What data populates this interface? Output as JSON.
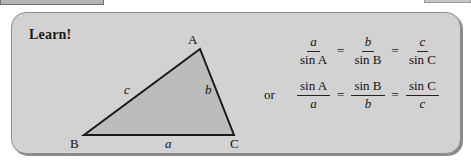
{
  "panel": {
    "heading": "Learn!",
    "background_color": "#d2d2d2",
    "border_color": "#8d8d8d"
  },
  "figure": {
    "fill_color": "#bcbcbc",
    "stroke_color": "#1a1a1a",
    "vertices": [
      {
        "name": "A",
        "label": "A",
        "x": 143,
        "y": 22
      },
      {
        "name": "B",
        "label": "B",
        "x": 27,
        "y": 108
      },
      {
        "name": "C",
        "label": "C",
        "x": 177,
        "y": 108
      }
    ],
    "sides": [
      {
        "name": "side-a",
        "label": "a",
        "between": "B-C"
      },
      {
        "name": "side-b",
        "label": "b",
        "between": "A-C"
      },
      {
        "name": "side-c",
        "label": "c",
        "between": "A-B"
      }
    ]
  },
  "formulas": {
    "connector": "or",
    "line1": [
      {
        "num": "a",
        "num_italic": true,
        "den": "sin A",
        "den_italic": false
      },
      {
        "num": "b",
        "num_italic": true,
        "den": "sin B",
        "den_italic": false
      },
      {
        "num": "c",
        "num_italic": true,
        "den": "sin C",
        "den_italic": false
      }
    ],
    "line2": [
      {
        "num": "sin A",
        "num_italic": false,
        "den": "a",
        "den_italic": true
      },
      {
        "num": "sin B",
        "num_italic": false,
        "den": "b",
        "den_italic": true
      },
      {
        "num": "sin C",
        "num_italic": false,
        "den": "c",
        "den_italic": true
      }
    ],
    "equals": "="
  }
}
